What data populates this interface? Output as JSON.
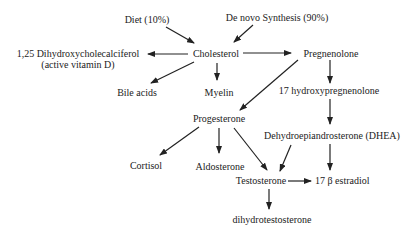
{
  "diagram": {
    "nodes": {
      "diet": "Diet (10%)",
      "denovo": "De novo Synthesis (90%)",
      "vitd_line1": "1,25 Dihydroxycholecalciferol",
      "vitd_line2": "(active vitamin D)",
      "cholesterol": "Cholesterol",
      "pregnenolone": "Pregnenolone",
      "bile_acids": "Bile acids",
      "myelin": "Myelin",
      "hydroxypreg": "17 hydroxypregnenolone",
      "progesterone": "Progesterone",
      "dhea": "Dehydroepiandrosterone (DHEA)",
      "cortisol": "Cortisol",
      "aldosterone": "Aldosterone",
      "testosterone": "Testosterone",
      "estradiol": "17 β estradiol",
      "dht": "dihydrotestosterone"
    },
    "edges": [
      [
        "diet",
        "cholesterol"
      ],
      [
        "denovo",
        "cholesterol"
      ],
      [
        "cholesterol",
        "vitd"
      ],
      [
        "cholesterol",
        "bile_acids"
      ],
      [
        "cholesterol",
        "myelin"
      ],
      [
        "cholesterol",
        "pregnenolone"
      ],
      [
        "pregnenolone",
        "progesterone"
      ],
      [
        "pregnenolone",
        "hydroxypreg"
      ],
      [
        "hydroxypreg",
        "dhea"
      ],
      [
        "progesterone",
        "cortisol"
      ],
      [
        "progesterone",
        "aldosterone"
      ],
      [
        "progesterone",
        "testosterone"
      ],
      [
        "dhea",
        "testosterone"
      ],
      [
        "dhea",
        "estradiol"
      ],
      [
        "testosterone",
        "estradiol"
      ],
      [
        "testosterone",
        "dht"
      ]
    ]
  }
}
